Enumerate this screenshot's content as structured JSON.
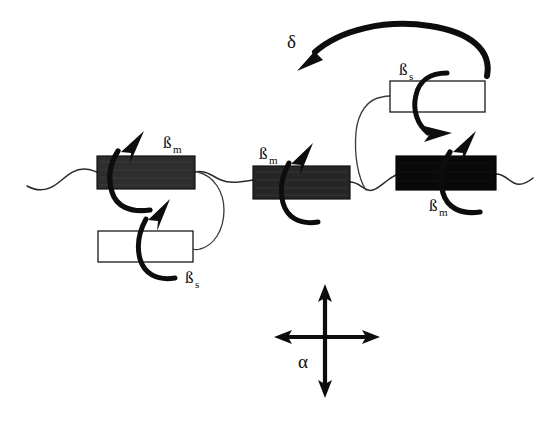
{
  "figure": {
    "background_color": "#ffffff",
    "ink_color": "#0d0d0d",
    "width": 545,
    "height": 423
  },
  "labels": {
    "beta_m_1": {
      "base": "ß",
      "sub": "m"
    },
    "beta_m_2": {
      "base": "ß",
      "sub": "m"
    },
    "beta_m_3": {
      "base": "ß",
      "sub": "m"
    },
    "beta_s_lower": {
      "base": "ß",
      "sub": "s"
    },
    "beta_s_upper": {
      "base": "ß",
      "sub": "s"
    },
    "delta": {
      "base": "δ"
    },
    "alpha": {
      "base": "α"
    }
  },
  "blocks": [
    {
      "name": "main-chain-mesogen-1",
      "kind": "filled",
      "fill": "#2d2d2d",
      "stroke": "#111111",
      "x": 97,
      "y": 156,
      "width": 98,
      "height": 33,
      "label": "ßm"
    },
    {
      "name": "main-chain-mesogen-2",
      "kind": "filled",
      "fill": "#262626",
      "stroke": "#111111",
      "x": 253,
      "y": 166,
      "width": 97,
      "height": 33,
      "label": "ßm"
    },
    {
      "name": "main-chain-mesogen-3",
      "kind": "filled",
      "fill": "#090909",
      "stroke": "#050505",
      "x": 396,
      "y": 156,
      "width": 100,
      "height": 34,
      "label": "ßm"
    },
    {
      "name": "side-chain-mesogen-lower",
      "kind": "open",
      "fill": "#ffffff",
      "stroke": "#1a1a1a",
      "x": 98,
      "y": 231,
      "width": 95,
      "height": 31,
      "label": "ßs"
    },
    {
      "name": "side-chain-mesogen-upper",
      "kind": "open",
      "fill": "#ffffff",
      "stroke": "#1a1a1a",
      "x": 390,
      "y": 81,
      "width": 95,
      "height": 31,
      "label": "ßs"
    }
  ],
  "axes_symbol": {
    "name": "alpha-reorientation-cross",
    "center_x": 325,
    "center_y": 337,
    "vertical_top": 286,
    "vertical_bottom": 396,
    "horizontal_left": 275,
    "horizontal_right": 379,
    "label": "α"
  },
  "delta_arc": {
    "name": "delta-long-range-arc",
    "label": "δ",
    "label_x": 292,
    "label_y": 42,
    "start_x": 487,
    "start_y": 76,
    "end_x": 302,
    "end_y": 64
  }
}
